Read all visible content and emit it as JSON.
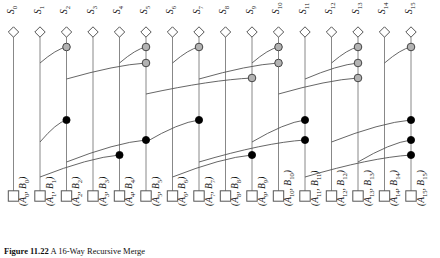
{
  "figure": {
    "caption": "Figure 11.22   A 16-Way Recursive Merge",
    "caption_label": "Figure 11.22",
    "caption_text": "A 16-Way Recursive Merge"
  },
  "colors": {
    "line": "#555555",
    "timeline": "#888888",
    "gray_node_fill": "#b3b3b3",
    "gray_node_stroke": "#444444",
    "black_node_fill": "#000000",
    "black_node_stroke": "#000000",
    "marker_stroke": "#555555",
    "marker_fill": "#ffffff",
    "background": "#ffffff",
    "text": "#111111"
  },
  "geometry": {
    "width": 440,
    "height": 258,
    "column_x": [
      13.5,
      40.0,
      66.5,
      93.0,
      119.5,
      146.0,
      172.5,
      199.0,
      225.5,
      252.0,
      278.5,
      305.0,
      331.5,
      358.0,
      384.5,
      411.0
    ],
    "top_marker_y": 32,
    "top_marker_size": 5.2,
    "bottom_marker_y": 196,
    "bottom_marker_size": 5.2,
    "timeline_top": 37,
    "timeline_bottom": 192
  },
  "top_labels": [
    {
      "base": "S",
      "sub": "0"
    },
    {
      "base": "S",
      "sub": "1"
    },
    {
      "base": "S",
      "sub": "2"
    },
    {
      "base": "S",
      "sub": "3"
    },
    {
      "base": "S",
      "sub": "4"
    },
    {
      "base": "S",
      "sub": "5"
    },
    {
      "base": "S",
      "sub": "6"
    },
    {
      "base": "S",
      "sub": "7"
    },
    {
      "base": "S",
      "sub": "8"
    },
    {
      "base": "S",
      "sub": "9"
    },
    {
      "base": "S",
      "sub": "10"
    },
    {
      "base": "S",
      "sub": "11"
    },
    {
      "base": "S",
      "sub": "12"
    },
    {
      "base": "S",
      "sub": "13"
    },
    {
      "base": "S",
      "sub": "14"
    },
    {
      "base": "S",
      "sub": "15"
    }
  ],
  "bottom_labels": [
    {
      "a": "A",
      "asub": "0",
      "b": "B",
      "bsub": "0"
    },
    {
      "a": "A",
      "asub": "1",
      "b": "B",
      "bsub": "1"
    },
    {
      "a": "A",
      "asub": "2",
      "b": "B",
      "bsub": "2"
    },
    {
      "a": "A",
      "asub": "3",
      "b": "B",
      "bsub": "3"
    },
    {
      "a": "A",
      "asub": "4",
      "b": "B",
      "bsub": "4"
    },
    {
      "a": "A",
      "asub": "5",
      "b": "B",
      "bsub": "5"
    },
    {
      "a": "A",
      "asub": "6",
      "b": "B",
      "bsub": "6"
    },
    {
      "a": "A",
      "asub": "7",
      "b": "B",
      "bsub": "7"
    },
    {
      "a": "A",
      "asub": "8",
      "b": "B",
      "bsub": "8"
    },
    {
      "a": "A",
      "asub": "9",
      "b": "B",
      "bsub": "9"
    },
    {
      "a": "A",
      "asub": "10",
      "b": "B",
      "bsub": "10"
    },
    {
      "a": "A",
      "asub": "11",
      "b": "B",
      "bsub": "11"
    },
    {
      "a": "A",
      "asub": "12",
      "b": "B",
      "bsub": "12"
    },
    {
      "a": "A",
      "asub": "13",
      "b": "B",
      "bsub": "13"
    },
    {
      "a": "A",
      "asub": "14",
      "b": "B",
      "bsub": "14"
    },
    {
      "a": "A",
      "asub": "15",
      "b": "B",
      "bsub": "15"
    }
  ],
  "chart_data": {
    "type": "diagram",
    "title": "A 16-Way Recursive Merge",
    "n_timelines": 16,
    "levels": [
      {
        "level": 1,
        "node_style": "gray",
        "stage_y": 47,
        "merges": [
          {
            "from": 1,
            "to": 2
          },
          {
            "from": 4,
            "to": 5
          },
          {
            "from": 6,
            "to": 7
          },
          {
            "from": 9,
            "to": 10
          },
          {
            "from": 12,
            "to": 13
          },
          {
            "from": 14,
            "to": 15
          }
        ]
      },
      {
        "level": 2,
        "node_style": "gray",
        "stage_y": 63,
        "merges": [
          {
            "from": 2,
            "to": 5
          },
          {
            "from": 7,
            "to": 10
          },
          {
            "from": 11,
            "to": 13
          }
        ]
      },
      {
        "level": 3,
        "node_style": "gray",
        "stage_y": 78,
        "merges": [
          {
            "from": 5,
            "to": 9
          },
          {
            "from": 10,
            "to": 13
          }
        ]
      },
      {
        "level": 4,
        "node_style": "black",
        "stage_y": 120,
        "merges": [
          {
            "from": 1,
            "to": 2
          },
          {
            "from": 5,
            "to": 7
          },
          {
            "from": 9,
            "to": 11
          },
          {
            "from": 12,
            "to": 15
          }
        ]
      },
      {
        "level": 5,
        "node_style": "black",
        "stage_y": 140,
        "merges": [
          {
            "from": 2,
            "to": 5
          },
          {
            "from": 7,
            "to": 11
          },
          {
            "from": 13,
            "to": 15
          }
        ]
      },
      {
        "level": 6,
        "node_style": "black",
        "stage_y": 155,
        "merges": [
          {
            "from": 1,
            "to": 4
          },
          {
            "from": 6,
            "to": 9
          },
          {
            "from": 11,
            "to": 15
          }
        ]
      }
    ],
    "top_marker_shape": "diamond",
    "bottom_marker_shape": "square",
    "gray_node_count": 14,
    "black_node_count": 18
  }
}
